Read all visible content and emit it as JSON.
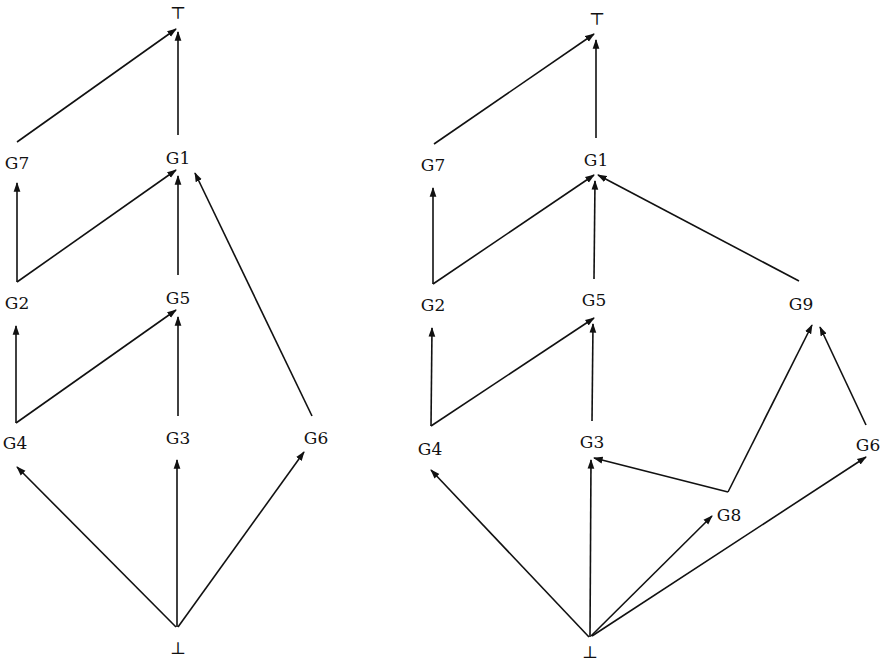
{
  "figure": {
    "colors": {
      "ink": "#111111",
      "background": "#ffffff"
    }
  },
  "graphs": [
    {
      "id": "left",
      "nodes": [
        {
          "id": "top",
          "label": "⊤",
          "x": 178,
          "y": 13
        },
        {
          "id": "G7",
          "label": "G7",
          "x": 17,
          "y": 163
        },
        {
          "id": "G1",
          "label": "G1",
          "x": 178,
          "y": 158
        },
        {
          "id": "G2",
          "label": "G2",
          "x": 17,
          "y": 303
        },
        {
          "id": "G5",
          "label": "G5",
          "x": 178,
          "y": 298
        },
        {
          "id": "G4",
          "label": "G4",
          "x": 15,
          "y": 443
        },
        {
          "id": "G3",
          "label": "G3",
          "x": 178,
          "y": 438
        },
        {
          "id": "G6",
          "label": "G6",
          "x": 316,
          "y": 438
        },
        {
          "id": "bottom",
          "label": "⊥",
          "x": 178,
          "y": 648
        }
      ],
      "edges": [
        {
          "from": "G7",
          "to": "top",
          "x1": 17,
          "y1": 142,
          "x2": 176,
          "y2": 29
        },
        {
          "from": "G1",
          "to": "top",
          "x1": 178,
          "y1": 135,
          "x2": 178,
          "y2": 32
        },
        {
          "from": "G2",
          "to": "G7",
          "x1": 17,
          "y1": 282,
          "x2": 17,
          "y2": 183
        },
        {
          "from": "G2",
          "to": "G1",
          "x1": 17,
          "y1": 282,
          "x2": 176,
          "y2": 170
        },
        {
          "from": "G5",
          "to": "G1",
          "x1": 178,
          "y1": 275,
          "x2": 178,
          "y2": 176
        },
        {
          "from": "G6",
          "to": "G1",
          "x1": 312,
          "y1": 416,
          "x2": 195,
          "y2": 173
        },
        {
          "from": "G4",
          "to": "G2",
          "x1": 16,
          "y1": 423,
          "x2": 16,
          "y2": 326
        },
        {
          "from": "G4",
          "to": "G5",
          "x1": 16,
          "y1": 423,
          "x2": 176,
          "y2": 310
        },
        {
          "from": "G3",
          "to": "G5",
          "x1": 178,
          "y1": 416,
          "x2": 178,
          "y2": 317
        },
        {
          "from": "bottom",
          "to": "G4",
          "x1": 176,
          "y1": 627,
          "x2": 17,
          "y2": 467
        },
        {
          "from": "bottom",
          "to": "G3",
          "x1": 177,
          "y1": 627,
          "x2": 177,
          "y2": 460
        },
        {
          "from": "bottom",
          "to": "G6",
          "x1": 178,
          "y1": 627,
          "x2": 304,
          "y2": 452
        }
      ]
    },
    {
      "id": "right",
      "nodes": [
        {
          "id": "top",
          "label": "⊤",
          "x": 597,
          "y": 19
        },
        {
          "id": "G7",
          "label": "G7",
          "x": 433,
          "y": 165
        },
        {
          "id": "G1",
          "label": "G1",
          "x": 596,
          "y": 160
        },
        {
          "id": "G2",
          "label": "G2",
          "x": 433,
          "y": 305
        },
        {
          "id": "G5",
          "label": "G5",
          "x": 594,
          "y": 300
        },
        {
          "id": "G9",
          "label": "G9",
          "x": 801,
          "y": 304
        },
        {
          "id": "G4",
          "label": "G4",
          "x": 430,
          "y": 449
        },
        {
          "id": "G3",
          "label": "G3",
          "x": 592,
          "y": 442
        },
        {
          "id": "G6",
          "label": "G6",
          "x": 868,
          "y": 445
        },
        {
          "id": "G8",
          "label": "G8",
          "x": 729,
          "y": 515
        },
        {
          "id": "bottom",
          "label": "⊥",
          "x": 590,
          "y": 652
        }
      ],
      "edges": [
        {
          "from": "G7",
          "to": "top",
          "x1": 434,
          "y1": 144,
          "x2": 594,
          "y2": 34
        },
        {
          "from": "G1",
          "to": "top",
          "x1": 596,
          "y1": 138,
          "x2": 596,
          "y2": 40
        },
        {
          "from": "G2",
          "to": "G7",
          "x1": 433,
          "y1": 284,
          "x2": 433,
          "y2": 188
        },
        {
          "from": "G2",
          "to": "G1",
          "x1": 433,
          "y1": 284,
          "x2": 594,
          "y2": 175
        },
        {
          "from": "G5",
          "to": "G1",
          "x1": 594,
          "y1": 279,
          "x2": 595,
          "y2": 181
        },
        {
          "from": "G9",
          "to": "G1",
          "x1": 799,
          "y1": 281,
          "x2": 598,
          "y2": 175
        },
        {
          "from": "G4",
          "to": "G2",
          "x1": 431,
          "y1": 426,
          "x2": 432,
          "y2": 328
        },
        {
          "from": "G4",
          "to": "G5",
          "x1": 431,
          "y1": 426,
          "x2": 594,
          "y2": 318
        },
        {
          "from": "G3",
          "to": "G5",
          "x1": 592,
          "y1": 421,
          "x2": 593,
          "y2": 324
        },
        {
          "from": "G8",
          "to": "G3",
          "x1": 728,
          "y1": 492,
          "x2": 594,
          "y2": 458
        },
        {
          "from": "G8",
          "to": "G9",
          "x1": 728,
          "y1": 492,
          "x2": 812,
          "y2": 325
        },
        {
          "from": "G6",
          "to": "G9",
          "x1": 866,
          "y1": 425,
          "x2": 820,
          "y2": 327
        },
        {
          "from": "bottom",
          "to": "G4",
          "x1": 589,
          "y1": 637,
          "x2": 431,
          "y2": 470
        },
        {
          "from": "bottom",
          "to": "G3",
          "x1": 590,
          "y1": 637,
          "x2": 591,
          "y2": 460
        },
        {
          "from": "bottom",
          "to": "G8",
          "x1": 591,
          "y1": 636,
          "x2": 712,
          "y2": 516
        },
        {
          "from": "bottom",
          "to": "G6",
          "x1": 592,
          "y1": 636,
          "x2": 866,
          "y2": 457
        }
      ]
    }
  ]
}
